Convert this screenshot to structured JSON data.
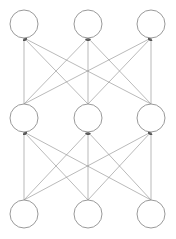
{
  "diagram": {
    "type": "fully-connected-neural-network",
    "colors": {
      "node_stroke": "#9a9a9a",
      "edge_stroke": "#8c8c8c",
      "background": "#ffffff"
    },
    "node_radius": 14,
    "layers": [
      {
        "name": "top",
        "nodes": [
          {
            "x": 24,
            "y": 24
          },
          {
            "x": 88,
            "y": 24
          },
          {
            "x": 151,
            "y": 24
          }
        ]
      },
      {
        "name": "middle",
        "nodes": [
          {
            "x": 24,
            "y": 118
          },
          {
            "x": 88,
            "y": 118
          },
          {
            "x": 151,
            "y": 118
          }
        ]
      },
      {
        "name": "bottom",
        "nodes": [
          {
            "x": 24,
            "y": 214
          },
          {
            "x": 88,
            "y": 214
          },
          {
            "x": 151,
            "y": 214
          }
        ]
      }
    ],
    "edges": "all nodes of each lower layer connect with arrows to all nodes of the layer above"
  }
}
